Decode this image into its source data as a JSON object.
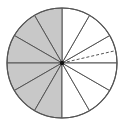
{
  "diagram": {
    "type": "fraction-circle",
    "center": [
      62,
      63
    ],
    "radius": 55,
    "total_sectors": 12,
    "shaded_sectors": 6,
    "shaded_side": "left",
    "colors": {
      "shade": "#c8c8c8",
      "stroke": "#555555",
      "background": "#ffffff",
      "center_dot": "#111111"
    },
    "dashed_line": {
      "angle_deg": 13,
      "description": "dashed radius in upper-right sector"
    }
  }
}
